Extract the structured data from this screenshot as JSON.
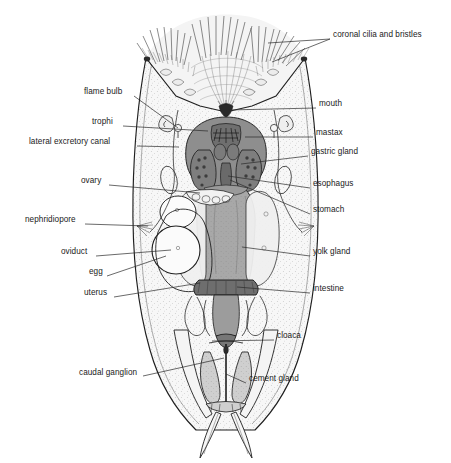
{
  "figure": {
    "background_color": "#ffffff",
    "ink_color": "#1a1a1a",
    "leader_color": "#2a2a2a",
    "fills": {
      "body_stipple": "#f2f2f2",
      "mastax": "#8e8e8e",
      "gastric_gland": "#7e7e7e",
      "stomach": "#a8a8a8",
      "intestine": "#6e6e6e",
      "cloaca": "#777777",
      "yolk_gland": "#efefef",
      "egg": "#fbfbfb",
      "cement_gland": "#c9c9c9",
      "corona": "#e8e8e8"
    }
  },
  "labels": {
    "left": [
      {
        "id": "flame-bulb",
        "text": "flame bulb",
        "x": 84,
        "y": 92,
        "anchor_x": 134,
        "anchor_y": 96,
        "tip_x": 178,
        "tip_y": 128
      },
      {
        "id": "trophi",
        "text": "trophi",
        "x": 92,
        "y": 122,
        "anchor_x": 123,
        "anchor_y": 126,
        "tip_x": 208,
        "tip_y": 131
      },
      {
        "id": "lateral-excretory-canal",
        "text": "lateral excretory canal",
        "x": 29,
        "y": 142,
        "anchor_x": 137,
        "anchor_y": 146,
        "tip_x": 179,
        "tip_y": 147
      },
      {
        "id": "ovary",
        "text": "ovary",
        "x": 81,
        "y": 181,
        "anchor_x": 109,
        "anchor_y": 185,
        "tip_x": 200,
        "tip_y": 193
      },
      {
        "id": "nephridiopore",
        "text": "nephridiopore",
        "x": 25,
        "y": 220,
        "anchor_x": 85,
        "anchor_y": 224,
        "tip_x": 148,
        "tip_y": 226
      },
      {
        "id": "oviduct",
        "text": "oviduct",
        "x": 61,
        "y": 252,
        "anchor_x": 96,
        "anchor_y": 256,
        "tip_x": 171,
        "tip_y": 250
      },
      {
        "id": "egg",
        "text": "egg",
        "x": 89,
        "y": 272,
        "anchor_x": 107,
        "anchor_y": 276,
        "tip_x": 166,
        "tip_y": 256
      },
      {
        "id": "uterus",
        "text": "uterus",
        "x": 84,
        "y": 293,
        "anchor_x": 114,
        "anchor_y": 297,
        "tip_x": 200,
        "tip_y": 283
      },
      {
        "id": "caudal-ganglion",
        "text": "caudal ganglion",
        "x": 79,
        "y": 373,
        "anchor_x": 143,
        "anchor_y": 376,
        "tip_x": 224,
        "tip_y": 358
      }
    ],
    "right": [
      {
        "id": "coronal-cilia-and-bristles",
        "text": "coronal cilia and bristles",
        "x": 333,
        "y": 35,
        "anchor_x": 330,
        "anchor_y": 39,
        "tip_x": 268,
        "tip_y": 43,
        "tip2_x": 272,
        "tip2_y": 62
      },
      {
        "id": "mouth",
        "text": "mouth",
        "x": 319,
        "y": 104,
        "anchor_x": 316,
        "anchor_y": 108,
        "tip_x": 228,
        "tip_y": 110
      },
      {
        "id": "mastax",
        "text": "mastax",
        "x": 316,
        "y": 133,
        "anchor_x": 313,
        "anchor_y": 137,
        "tip_x": 245,
        "tip_y": 137
      },
      {
        "id": "gastric-gland",
        "text": "gastric gland",
        "x": 311,
        "y": 152,
        "anchor_x": 308,
        "anchor_y": 156,
        "tip_x": 241,
        "tip_y": 164
      },
      {
        "id": "esophagus",
        "text": "esophagus",
        "x": 313,
        "y": 184,
        "anchor_x": 310,
        "anchor_y": 188,
        "tip_x": 228,
        "tip_y": 176
      },
      {
        "id": "stomach",
        "text": "stomach",
        "x": 313,
        "y": 210,
        "anchor_x": 310,
        "anchor_y": 214,
        "tip_x": 230,
        "tip_y": 180
      },
      {
        "id": "yolk-gland",
        "text": "yolk gland",
        "x": 313,
        "y": 252,
        "anchor_x": 310,
        "anchor_y": 256,
        "tip_x": 242,
        "tip_y": 247
      },
      {
        "id": "intestine",
        "text": "intestine",
        "x": 313,
        "y": 289,
        "anchor_x": 310,
        "anchor_y": 293,
        "tip_x": 237,
        "tip_y": 287
      },
      {
        "id": "cloaca",
        "text": "cloaca",
        "x": 277,
        "y": 336,
        "anchor_x": 274,
        "anchor_y": 340,
        "tip_x": 212,
        "tip_y": 341
      },
      {
        "id": "cement-gland",
        "text": "cement gland",
        "x": 249,
        "y": 379,
        "anchor_x": 246,
        "anchor_y": 383,
        "tip_x": 226,
        "tip_y": 374
      }
    ]
  }
}
